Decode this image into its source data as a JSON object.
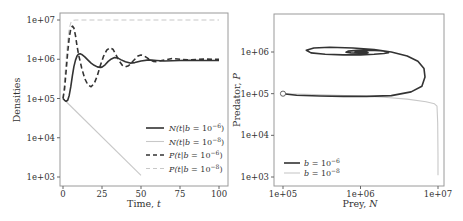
{
  "chart_data": [
    {
      "type": "line",
      "title": "",
      "xlabel": "Time, t",
      "ylabel": "Densities",
      "yscale": "log",
      "xlim": [
        0,
        100
      ],
      "ylim": [
        1000,
        10000000
      ],
      "xticks": [
        0,
        25,
        50,
        75,
        100
      ],
      "xtick_labels": [
        "0",
        "25",
        "50",
        "75",
        "100"
      ],
      "yticks": [
        1000,
        10000,
        100000,
        1000000,
        10000000
      ],
      "ytick_labels": [
        "1e+03",
        "1e+04",
        "1e+05",
        "1e+06",
        "1e+07"
      ],
      "grid": false,
      "legend_position": "lower right",
      "series": [
        {
          "name": "N(t|b = 10^-6)",
          "label_main": "N(t|b = 10",
          "label_sup": "−6",
          "style": "solid",
          "color": "#333333",
          "width": 1.6,
          "x": [
            0,
            1,
            2,
            3,
            4,
            5,
            6,
            7,
            8,
            9,
            10,
            11,
            12,
            14,
            16,
            18,
            20,
            22,
            24,
            25,
            27,
            29,
            31,
            33,
            35,
            37,
            40,
            43,
            46,
            50,
            55,
            60,
            65,
            70,
            80,
            90,
            100
          ],
          "y": [
            100000,
            90000,
            85000,
            90000,
            120000,
            200000,
            380000,
            650000,
            950000,
            1200000,
            1350000,
            1380000,
            1330000,
            1150000,
            950000,
            800000,
            700000,
            640000,
            620000,
            630000,
            720000,
            880000,
            1020000,
            1100000,
            1080000,
            980000,
            860000,
            800000,
            820000,
            900000,
            960000,
            930000,
            900000,
            920000,
            940000,
            930000,
            930000
          ]
        },
        {
          "name": "N(t|b = 10^-8)",
          "label_main": "N(t|b = 10",
          "label_sup": "−8",
          "style": "solid",
          "color": "#c8c8c8",
          "width": 1.1,
          "x": [
            0,
            50
          ],
          "y": [
            100000,
            1100
          ]
        },
        {
          "name": "P(t|b = 10^-6)",
          "label_main": "P(t|b = 10",
          "label_sup": "−6",
          "style": "dashed",
          "color": "#333333",
          "width": 1.6,
          "x": [
            0,
            1,
            2,
            3,
            4,
            5,
            6,
            7,
            8,
            9,
            10,
            12,
            14,
            16,
            18,
            20,
            22,
            24,
            26,
            28,
            30,
            32,
            34,
            36,
            38,
            40,
            42,
            44,
            46,
            48,
            50,
            52,
            54,
            56,
            58,
            60,
            65,
            70,
            75,
            80,
            90,
            100
          ],
          "y": [
            100000,
            180000,
            500000,
            1500000,
            3500000,
            6000000,
            7000000,
            6200000,
            4000000,
            2200000,
            1300000,
            600000,
            320000,
            220000,
            200000,
            240000,
            380000,
            700000,
            1200000,
            1700000,
            1950000,
            1800000,
            1300000,
            900000,
            700000,
            640000,
            680000,
            820000,
            1000000,
            1200000,
            1280000,
            1220000,
            1080000,
            950000,
            880000,
            870000,
            950000,
            1050000,
            1000000,
            960000,
            1010000,
            990000
          ]
        },
        {
          "name": "P(t|b = 10^-8)",
          "label_main": "P(t|b = 10",
          "label_sup": "−8",
          "style": "dashed",
          "color": "#c8c8c8",
          "width": 1.1,
          "x": [
            0,
            1,
            2,
            3,
            4,
            5,
            6,
            7,
            8,
            10,
            20,
            40,
            60,
            80,
            100
          ],
          "y": [
            100000,
            300000,
            1000000,
            3000000,
            6000000,
            8500000,
            9600000,
            9900000,
            10000000,
            10000000,
            10000000,
            10000000,
            10000000,
            10000000,
            10000000
          ]
        }
      ]
    },
    {
      "type": "line",
      "title": "",
      "xlabel": "Prey, N",
      "ylabel": "Predator, P",
      "xscale": "log",
      "yscale": "log",
      "xlim": [
        70000,
        14000000
      ],
      "ylim": [
        800,
        10000000
      ],
      "xticks": [
        100000,
        1000000,
        10000000
      ],
      "xtick_labels": [
        "1e+05",
        "1e+06",
        "1e+07"
      ],
      "yticks": [
        1000,
        10000,
        100000,
        1000000
      ],
      "ytick_labels": [
        "1e+03",
        "1e+04",
        "1e+05",
        "1e+06"
      ],
      "grid": false,
      "legend_position": "lower left",
      "start_marker": {
        "x": 100000,
        "y": 100000,
        "shape": "open-circle"
      },
      "series": [
        {
          "name": "b = 10^-6",
          "label_main": "b = 10",
          "label_sup": "−6",
          "style": "solid",
          "color": "#333333",
          "width": 1.6,
          "x": [
            100000,
            150000,
            300000,
            600000,
            1200000,
            2500000,
            4500000,
            6200000,
            6800000,
            6600000,
            5500000,
            4000000,
            2500000,
            1500000,
            800000,
            400000,
            250000,
            200000,
            230000,
            350000,
            600000,
            1000000,
            1500000,
            2000000,
            2300000,
            2200000,
            1800000,
            1300000,
            900000,
            700000,
            650000,
            750000,
            950000,
            1150000,
            1250000,
            1200000,
            1050000,
            900000,
            850000,
            900000,
            1000000,
            1050000,
            1000000,
            950000,
            960000
          ],
          "y": [
            100000,
            92000,
            88000,
            86000,
            86000,
            90000,
            110000,
            150000,
            250000,
            400000,
            600000,
            800000,
            1000000,
            1150000,
            1250000,
            1300000,
            1250000,
            1100000,
            950000,
            880000,
            850000,
            850000,
            880000,
            920000,
            970000,
            1030000,
            1080000,
            1100000,
            1090000,
            1050000,
            990000,
            950000,
            930000,
            940000,
            970000,
            1000000,
            1020000,
            1010000,
            990000,
            970000,
            965000,
            975000,
            990000,
            985000,
            980000
          ]
        },
        {
          "name": "b = 10^-8",
          "label_main": "b = 10",
          "label_sup": "−8",
          "style": "solid",
          "color": "#c8c8c8",
          "width": 1.1,
          "x": [
            100000,
            200000,
            500000,
            1000000,
            2000000,
            4000000,
            7000000,
            9000000,
            9700000,
            9900000,
            10000000,
            10000000
          ],
          "y": [
            100000,
            97000,
            92000,
            88000,
            82000,
            74000,
            64000,
            57000,
            50000,
            20000,
            3000,
            1100
          ]
        }
      ]
    }
  ],
  "panels": {
    "left": {
      "ylabel": "Densities",
      "xlabel_main": "Time, ",
      "xlabel_var": "t"
    },
    "right": {
      "ylabel_main": "Predator, ",
      "ylabel_var": "P",
      "xlabel_main": "Prey, ",
      "xlabel_var": "N"
    }
  }
}
